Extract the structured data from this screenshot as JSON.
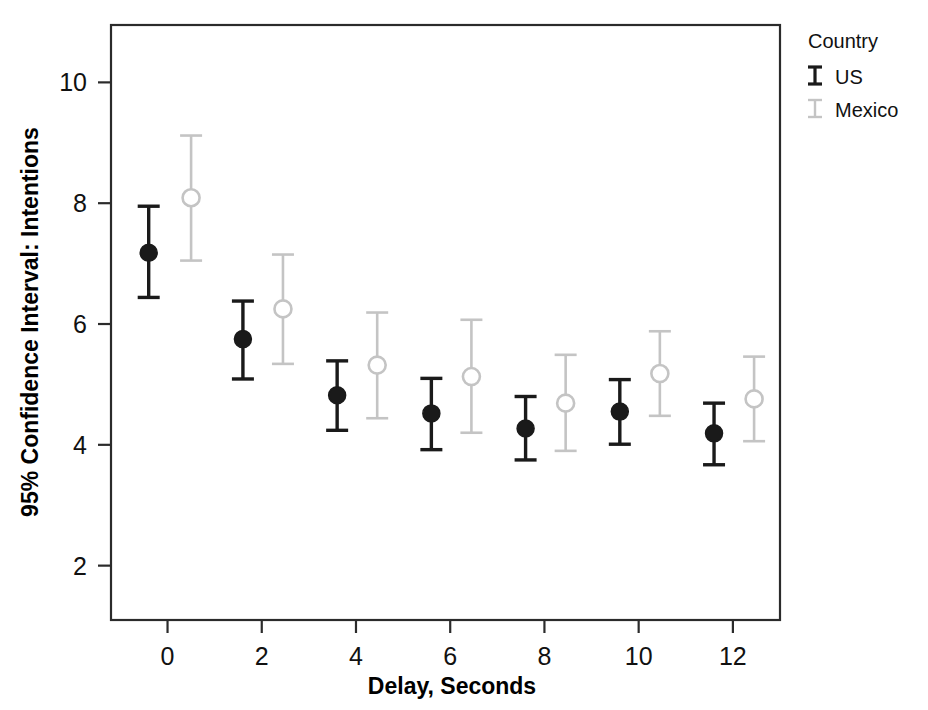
{
  "chart_data": {
    "type": "scatter",
    "title": "",
    "xlabel": "Delay, Seconds",
    "ylabel": "95% Confidence Interval: Intentions",
    "xlim": [
      -1.2,
      13.0
    ],
    "ylim": [
      1.1,
      10.95
    ],
    "xticks": [
      0,
      2,
      4,
      6,
      8,
      10,
      12
    ],
    "yticks": [
      2,
      4,
      6,
      8,
      10
    ],
    "xtick_labels": [
      "0",
      "2",
      "4",
      "6",
      "8",
      "10",
      "12"
    ],
    "ytick_labels": [
      "2",
      "4",
      "6",
      "8",
      "10"
    ],
    "grid": false,
    "legend_position": "top-right",
    "legend_title": "Country",
    "error_bar_type": "95% confidence interval",
    "series": [
      {
        "name": "US",
        "color": "#1a1a1a",
        "marker": "filled-circle",
        "x": [
          -0.4,
          1.6,
          3.6,
          5.6,
          7.6,
          9.6,
          11.6
        ],
        "values": [
          7.18,
          5.75,
          4.82,
          4.52,
          4.27,
          4.55,
          4.19
        ],
        "ci_low": [
          6.44,
          5.09,
          4.24,
          3.92,
          3.75,
          4.01,
          3.67
        ],
        "ci_high": [
          7.95,
          6.38,
          5.39,
          5.1,
          4.8,
          5.08,
          4.69
        ]
      },
      {
        "name": "Mexico",
        "color": "#c4c4c4",
        "marker": "open-circle",
        "x": [
          0.5,
          2.45,
          4.45,
          6.45,
          8.45,
          10.45,
          12.45
        ],
        "values": [
          8.09,
          6.25,
          5.32,
          5.13,
          4.69,
          5.18,
          4.76
        ],
        "ci_low": [
          7.05,
          5.34,
          4.44,
          4.2,
          3.9,
          4.48,
          4.06
        ],
        "ci_high": [
          9.12,
          7.15,
          6.19,
          6.07,
          5.49,
          5.88,
          5.46
        ]
      }
    ]
  },
  "legend": {
    "title": "Country",
    "entries": [
      {
        "label": "US",
        "color": "#1a1a1a",
        "glyph": "error-bar-icon"
      },
      {
        "label": "Mexico",
        "color": "#c4c4c4",
        "glyph": "error-bar-icon"
      }
    ]
  },
  "axes": {
    "x_title": "Delay, Seconds",
    "y_title": "95% Confidence Interval: Intentions"
  }
}
